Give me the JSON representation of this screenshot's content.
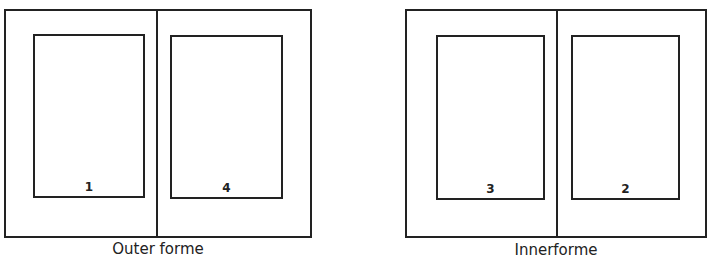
{
  "diagram": {
    "formes": [
      {
        "caption": "Outer forme",
        "pages": [
          {
            "number": "1"
          },
          {
            "number": "4"
          }
        ]
      },
      {
        "caption": "Innerforme",
        "pages": [
          {
            "number": "3"
          },
          {
            "number": "2"
          }
        ]
      }
    ],
    "colors": {
      "line": "#222222",
      "background": "#ffffff"
    }
  }
}
